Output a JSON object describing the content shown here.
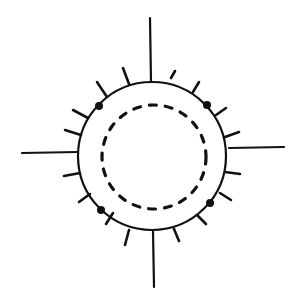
{
  "diagram": {
    "stroke_color": "#111111",
    "background": "#ffffff",
    "outer_circle": {
      "cx": 152,
      "cy": 156,
      "r": 74
    },
    "inner_circle": {
      "cx": 154,
      "cy": 157,
      "r": 52,
      "dash": "7 9"
    },
    "axis_lines": [
      {
        "name": "top",
        "x1": 150,
        "y1": 18,
        "x2": 151,
        "y2": 82
      },
      {
        "name": "bottom",
        "x1": 153,
        "y1": 231,
        "x2": 154,
        "y2": 287
      },
      {
        "name": "left",
        "x1": 22,
        "y1": 153,
        "x2": 78,
        "y2": 152
      },
      {
        "name": "right",
        "x1": 229,
        "y1": 148,
        "x2": 284,
        "y2": 147
      }
    ],
    "ticks": [
      {
        "x1": 123,
        "y1": 68,
        "x2": 129,
        "y2": 84
      },
      {
        "x1": 97,
        "y1": 82,
        "x2": 107,
        "y2": 97
      },
      {
        "x1": 73,
        "y1": 110,
        "x2": 88,
        "y2": 118
      },
      {
        "x1": 65,
        "y1": 130,
        "x2": 81,
        "y2": 135
      },
      {
        "x1": 64,
        "y1": 176,
        "x2": 80,
        "y2": 173
      },
      {
        "x1": 79,
        "y1": 202,
        "x2": 90,
        "y2": 194
      },
      {
        "x1": 106,
        "y1": 224,
        "x2": 113,
        "y2": 213
      },
      {
        "x1": 125,
        "y1": 245,
        "x2": 129,
        "y2": 230
      },
      {
        "x1": 171,
        "y1": 78,
        "x2": 175,
        "y2": 71
      },
      {
        "x1": 193,
        "y1": 92,
        "x2": 199,
        "y2": 82
      },
      {
        "x1": 216,
        "y1": 115,
        "x2": 226,
        "y2": 108
      },
      {
        "x1": 225,
        "y1": 137,
        "x2": 239,
        "y2": 132
      },
      {
        "x1": 225,
        "y1": 172,
        "x2": 240,
        "y2": 174
      },
      {
        "x1": 220,
        "y1": 193,
        "x2": 231,
        "y2": 200
      },
      {
        "x1": 197,
        "y1": 215,
        "x2": 206,
        "y2": 224
      },
      {
        "x1": 174,
        "y1": 229,
        "x2": 179,
        "y2": 241
      }
    ],
    "dots": [
      {
        "cx": 99,
        "cy": 106,
        "r": 4
      },
      {
        "cx": 207,
        "cy": 105,
        "r": 4
      },
      {
        "cx": 101,
        "cy": 210,
        "r": 4
      },
      {
        "cx": 210,
        "cy": 203,
        "r": 4
      }
    ]
  }
}
